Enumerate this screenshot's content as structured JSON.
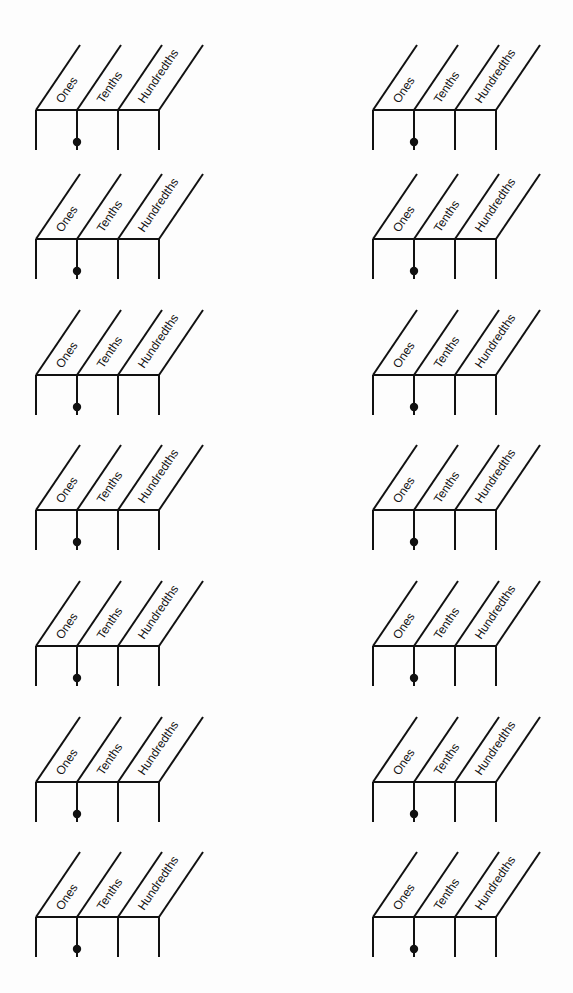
{
  "page": {
    "background": "#fdfdfd",
    "ink_color": "#111111"
  },
  "chart_template": {
    "column_labels": [
      "Ones",
      "Tenths",
      "Hundredths"
    ],
    "decimal_point_after": "Ones",
    "column_width": 41,
    "header_rise": 65,
    "header_run": 44,
    "body_depth": 40,
    "dot_offset_y": 32,
    "dot_radius": 4.2
  },
  "layout": {
    "columns_x": [
      36,
      373
    ],
    "rows_y": [
      110,
      239,
      375,
      510,
      646,
      782,
      917
    ]
  },
  "charts": [
    {
      "id": "r1c1",
      "labels": [
        "Ones",
        "Tenths",
        "Hundredths"
      ]
    },
    {
      "id": "r1c2",
      "labels": [
        "Ones",
        "Tenths",
        "Hundredths"
      ]
    },
    {
      "id": "r2c1",
      "labels": [
        "Ones",
        "Tenths",
        "Hundredths"
      ]
    },
    {
      "id": "r2c2",
      "labels": [
        "Ones",
        "Tenths",
        "Hundredths"
      ]
    },
    {
      "id": "r3c1",
      "labels": [
        "Ones",
        "Tenths",
        "Hundredths"
      ]
    },
    {
      "id": "r3c2",
      "labels": [
        "Ones",
        "Tenths",
        "Hundredths"
      ]
    },
    {
      "id": "r4c1",
      "labels": [
        "Ones",
        "Tenths",
        "Hundredths"
      ]
    },
    {
      "id": "r4c2",
      "labels": [
        "Ones",
        "Tenths",
        "Hundredths"
      ]
    },
    {
      "id": "r5c1",
      "labels": [
        "Ones",
        "Tenths",
        "Hundredths"
      ]
    },
    {
      "id": "r5c2",
      "labels": [
        "Ones",
        "Tenths",
        "Hundredths"
      ]
    },
    {
      "id": "r6c1",
      "labels": [
        "Ones",
        "Tenths",
        "Hundredths"
      ]
    },
    {
      "id": "r6c2",
      "labels": [
        "Ones",
        "Tenths",
        "Hundredths"
      ]
    },
    {
      "id": "r7c1",
      "labels": [
        "Ones",
        "Tenths",
        "Hundredths"
      ]
    },
    {
      "id": "r7c2",
      "labels": [
        "Ones",
        "Tenths",
        "Hundredths"
      ]
    }
  ]
}
